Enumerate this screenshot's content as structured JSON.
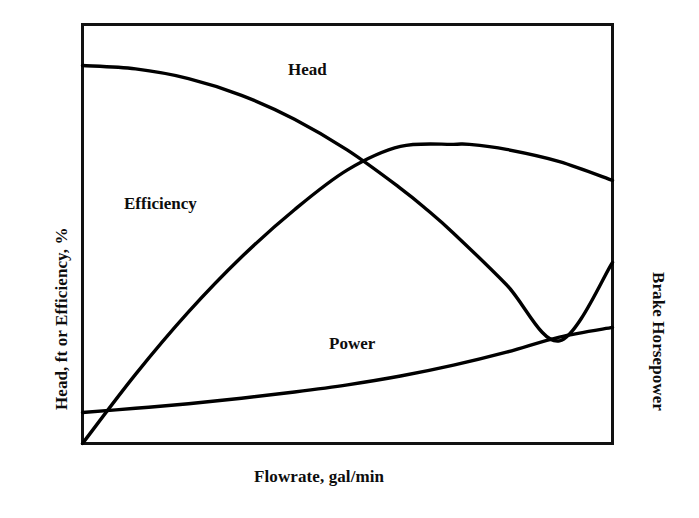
{
  "chart_data": {
    "type": "line",
    "title": "",
    "subtitle": "",
    "xlabel": "Flowrate, gal/min",
    "ylabel": "Head, ft or Efficiency, %",
    "ylabel_right": "Brake Horsepower",
    "grid": false,
    "legend_position": "inline-annotations",
    "axis_ticks": "none",
    "xlim": [
      0,
      100
    ],
    "ylim": [
      0,
      100
    ],
    "note": "Qualitative centrifugal pump performance curves; axes are unlabeled/unscaled, values below are normalized percentages of the plot frame (x: 0 at left edge to 100 at right edge; y: 0 at bottom edge to 100 at top edge).",
    "series": [
      {
        "name": "Head",
        "label": "Head",
        "color": "#000000",
        "x": [
          0,
          10,
          20,
          30,
          40,
          50,
          60,
          65,
          70,
          80,
          90,
          100
        ],
        "values": [
          90.2,
          89.4,
          87.1,
          83.1,
          77.4,
          70.0,
          60.9,
          55.8,
          50.2,
          37.9,
          24.5,
          43.2
        ]
      },
      {
        "name": "Efficiency",
        "label": "Efficiency",
        "color": "#000000",
        "x": [
          0,
          10,
          20,
          30,
          40,
          50,
          60,
          70,
          73,
          80,
          90,
          100
        ],
        "values": [
          0.0,
          16.5,
          31.4,
          44.5,
          55.8,
          65.3,
          70.9,
          71.4,
          71.4,
          70.2,
          67.3,
          62.8
        ]
      },
      {
        "name": "Power",
        "label": "Power",
        "color": "#000000",
        "x": [
          0,
          10,
          20,
          30,
          40,
          50,
          60,
          70,
          80,
          90,
          100
        ],
        "values": [
          7.4,
          8.4,
          9.5,
          10.8,
          12.3,
          14.0,
          16.1,
          18.7,
          21.8,
          25.4,
          27.7
        ]
      }
    ]
  },
  "axes": {
    "x_title": "Flowrate, gal/min",
    "y_title_left": "Head, ft or Efficiency, %",
    "y_title_right": "Brake Horsepower"
  },
  "annotations": {
    "head": "Head",
    "efficiency": "Efficiency",
    "power": "Power"
  },
  "style": {
    "background": "#ffffff",
    "frame_color": "#111111",
    "curve_color": "#000000"
  }
}
